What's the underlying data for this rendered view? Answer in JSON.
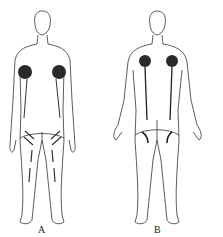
{
  "figures": [
    {
      "id": "A",
      "label": "A",
      "view": "anterior"
    },
    {
      "id": "B",
      "label": "B",
      "view": "posterior"
    }
  ],
  "colors": {
    "outline": "#333333",
    "mark": "#2a2a2a",
    "background": "#ffffff"
  }
}
